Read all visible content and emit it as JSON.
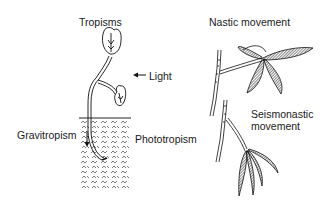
{
  "labels": {
    "tropisms": "Tropisms",
    "light": "Light",
    "gravitropism": "Gravitropism",
    "phototropism": "Phototropism",
    "nastic": "Nastic movement",
    "seismonastic_1": "Seismonastic",
    "seismonastic_2": "movement"
  },
  "colors": {
    "ink": "#1a1a1a",
    "background": "#ffffff"
  }
}
